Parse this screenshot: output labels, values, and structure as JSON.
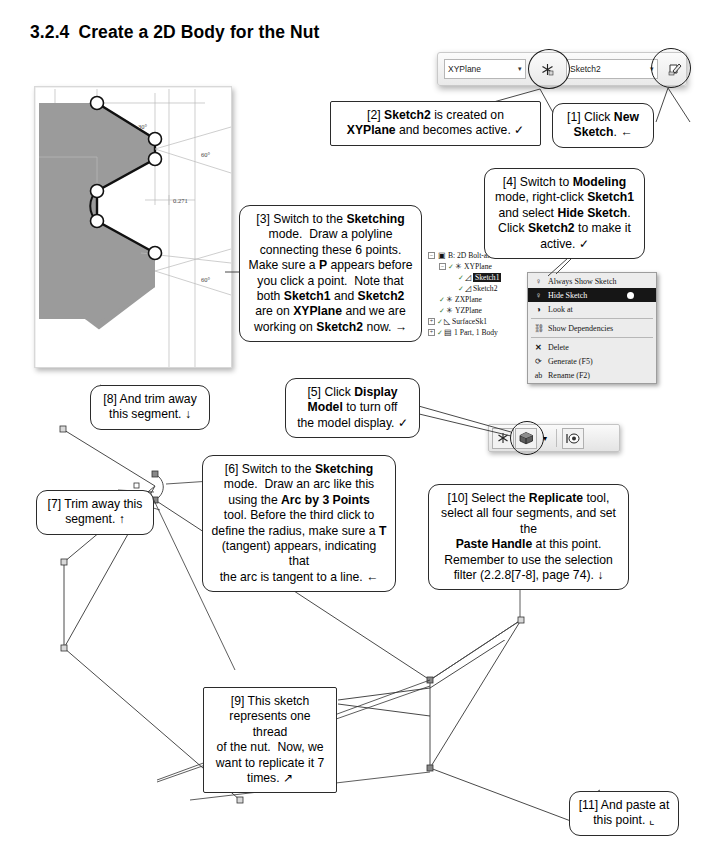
{
  "page": {
    "section_number": "3.2.4",
    "section_title": "Create a 2D Body for the Nut"
  },
  "toolbar": {
    "plane_select_value": "XYPlane",
    "plane_caret": "▾",
    "new_plane_icon": "new-plane-icon",
    "sketch_select_value": "Sketch2",
    "sketch_caret": "▾",
    "new_sketch_icon": "new-sketch-icon"
  },
  "tree": {
    "nodes": [
      {
        "label": "B: 2D Bolt-and-Nut",
        "icon": "project-icon",
        "expander": "−",
        "indent": 0,
        "selected": false,
        "check": false
      },
      {
        "label": "XYPlane",
        "icon": "plane-icon",
        "expander": "−",
        "indent": 1,
        "selected": false,
        "check": true
      },
      {
        "label": "Sketch1",
        "icon": "sketch-icon",
        "expander": "",
        "indent": 2,
        "selected": true,
        "check": true
      },
      {
        "label": "Sketch2",
        "icon": "sketch-icon",
        "expander": "",
        "indent": 2,
        "selected": false,
        "check": true
      },
      {
        "label": "ZXPlane",
        "icon": "plane-icon",
        "expander": "",
        "indent": 1,
        "selected": false,
        "check": true
      },
      {
        "label": "YZPlane",
        "icon": "plane-icon",
        "expander": "",
        "indent": 1,
        "selected": false,
        "check": true
      },
      {
        "label": "SurfaceSk1",
        "icon": "surface-icon",
        "expander": "+",
        "indent": 1,
        "selected": false,
        "check": true
      },
      {
        "label": "1 Part, 1 Body",
        "icon": "body-icon",
        "expander": "+",
        "indent": 1,
        "selected": false,
        "check": true
      }
    ]
  },
  "context_menu": {
    "items": [
      {
        "label": "Always Show Sketch",
        "icon": "lightbulb-off-icon",
        "active": false,
        "separator_after": false
      },
      {
        "label": "Hide Sketch",
        "icon": "lightbulb-on-icon",
        "active": true,
        "separator_after": false
      },
      {
        "label": "Look at",
        "icon": "look-at-icon",
        "active": false,
        "separator_after": true
      },
      {
        "label": "Show Dependencies",
        "icon": "dependencies-icon",
        "active": false,
        "separator_after": true
      },
      {
        "label": "Delete",
        "icon": "delete-x-icon",
        "active": false,
        "separator_after": false
      },
      {
        "label": "Generate (F5)",
        "icon": "generate-icon",
        "active": false,
        "separator_after": false
      },
      {
        "label": "Rename (F2)",
        "icon": "rename-icon",
        "active": false,
        "separator_after": false
      }
    ]
  },
  "display_toolbar": {
    "buttons": [
      {
        "icon": "new-plane-icon",
        "highlighted": false
      },
      {
        "icon": "display-model-icon",
        "highlighted": true
      },
      {
        "icon": "dropdown-caret-icon",
        "highlighted": false
      },
      {
        "icon": "look-at-icon",
        "highlighted": false
      }
    ]
  },
  "cad_figure": {
    "dimensions": [
      {
        "text": "30°"
      },
      {
        "text": "60°"
      },
      {
        "text": "0.271"
      },
      {
        "text": "60°"
      }
    ],
    "point_count": 6
  },
  "callouts": [
    {
      "id": 1,
      "text_runs": [
        {
          "t": "[1] Click ",
          "b": false
        },
        {
          "t": "New Sketch",
          "b": true
        },
        {
          "t": ". ←",
          "b": false
        }
      ],
      "plain": "[1] Click New Sketch. ←"
    },
    {
      "id": 2,
      "plain": "[2] Sketch2 is created on XYPlane and becomes active. ✓"
    },
    {
      "id": 3,
      "plain": "[3] Switch to the Sketching mode. Draw a polyline connecting these 6 points. Make sure a P appears before you click a point. Note that both Sketch1 and Sketch2 are on XYPlane and we are working on Sketch2 now. →"
    },
    {
      "id": 4,
      "plain": "[4] Switch to Modeling mode, right-click Sketch1 and select Hide Sketch. Click Sketch2 to make it active. ✓"
    },
    {
      "id": 5,
      "plain": "[5] Click Display Model to turn off the model display. ✓"
    },
    {
      "id": 6,
      "plain": "[6] Switch to the Sketching mode. Draw an arc like this using the Arc by 3 Points tool. Before the third click to define the radius, make sure a T (tangent) appears, indicating that the arc is tangent to a line. ←"
    },
    {
      "id": 7,
      "plain": "[7] Trim away this segment. ↑"
    },
    {
      "id": 8,
      "plain": "[8] And trim away this segment. ↓"
    },
    {
      "id": 9,
      "plain": "[9] This sketch represents one thread of the nut.  Now, we want to replicate it 7 times. ↗"
    },
    {
      "id": 10,
      "plain": "[10] Select the Replicate tool, select all four segments, and set the Paste Handle at this point. Remember to use the selection filter (2.2.8[7-8], page 74). ↓"
    },
    {
      "id": 11,
      "plain": "[11] And paste at this point. ⌐"
    }
  ],
  "callout_html": {
    "c1": "[1] Click <b>New<br>Sketch</b>. &#8592;",
    "c2": "[2] <b>Sketch2</b> is created on<br><b>XYPlane</b> and becomes active. &#10003;",
    "c3": "[3] Switch to the <b>Sketching</b><br>mode.&nbsp; Draw a polyline<br>connecting these 6 points.<br>Make sure a <b>P</b> appears before<br>you click a point.&nbsp; Note that<br>both <b>Sketch1</b> and <b>Sketch2</b><br>are on <b>XYPlane</b> and we are<br>working on <b>Sketch2</b> now. &#8594;",
    "c4": "[4] Switch to <b>Modeling</b><br>mode, right-click <b>Sketch1</b><br>and select <b>Hide Sketch</b>.<br>Click <b>Sketch2</b> to make it<br>active. &#10003;",
    "c5": "[5] Click <b>Display<br>Model</b> to turn off<br>the model display. &#10003;",
    "c6": "[6] Switch to the <b>Sketching</b><br>mode.&nbsp; Draw an arc like this<br>using the <b>Arc by 3 Points</b><br>tool. Before the third click to<br>define the radius, make sure a <b>T</b><br>(tangent) appears, indicating that<br>the arc is tangent to a line. &#8592;",
    "c7": "[7] Trim away this<br>segment. &#8593;",
    "c8": "[8] And trim away<br>this segment. &#8595;",
    "c9": "[9] This sketch<br>represents one thread<br>of the nut.&nbsp; Now, we<br>want to replicate it 7<br>times. &#8599;",
    "c10": "[10] Select the <b>Replicate</b> tool,<br>select all four segments, and set the<br><b>Paste Handle</b> at this point.<br>Remember to use the selection<br>filter (2.2.8[7-8], page 74). &#8595;",
    "c11": "[11] And paste at<br>this point. &#8990;"
  },
  "colors": {
    "ink": "#000000",
    "callout_border": "#2b2b2b",
    "cad_fill": "#9a9a9a",
    "menu_bg": "#ececec",
    "menu_highlight": "#161616",
    "sketch_line": "#555555"
  }
}
